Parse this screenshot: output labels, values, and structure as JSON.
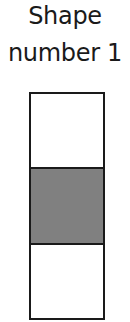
{
  "title": {
    "line1": "Shape",
    "line2": "number 1"
  },
  "shape": {
    "cells": [
      {
        "position": "top",
        "fill": "#ffffff",
        "shaded": false
      },
      {
        "position": "middle",
        "fill": "#808080",
        "shaded": true
      },
      {
        "position": "bottom",
        "fill": "#ffffff",
        "shaded": false
      }
    ],
    "border_color": "#1a1a1a"
  }
}
